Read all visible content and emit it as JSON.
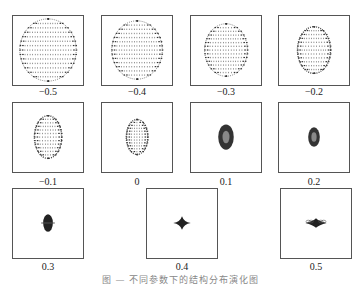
{
  "figure": {
    "panels": [
      {
        "label": "−0.5",
        "rx": 29,
        "ry": 32,
        "density": "sparse"
      },
      {
        "label": "−0.4",
        "rx": 26,
        "ry": 30,
        "density": "sparse"
      },
      {
        "label": "−0.3",
        "rx": 22,
        "ry": 27,
        "density": "sparse"
      },
      {
        "label": "−0.2",
        "rx": 17,
        "ry": 24,
        "density": "medium"
      },
      {
        "label": "−0.1",
        "rx": 14,
        "ry": 22,
        "density": "medium"
      },
      {
        "label": "0",
        "rx": 11,
        "ry": 18,
        "density": "medium"
      },
      {
        "label": "0.1",
        "rx": 8,
        "ry": 13,
        "density": "dense"
      },
      {
        "label": "0.2",
        "rx": 6,
        "ry": 10,
        "density": "dense"
      },
      {
        "label": "0.3",
        "rx": 5,
        "ry": 9,
        "density": "solid"
      },
      {
        "label": "0.4",
        "rx": 6,
        "ry": 6,
        "density": "star"
      },
      {
        "label": "0.5",
        "rx": 10,
        "ry": 3,
        "density": "flat"
      }
    ],
    "caption": "图 — 不同参数下的结构分布演化图"
  }
}
